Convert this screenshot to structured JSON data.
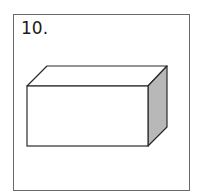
{
  "figure": {
    "label": "10.",
    "shape": "rectangular-prism",
    "colors": {
      "outline": "#2a2a2a",
      "front_face": "#ffffff",
      "top_face": "#ffffff",
      "side_face": "#b8b8b8",
      "frame_border": "#6a6a6a"
    }
  }
}
